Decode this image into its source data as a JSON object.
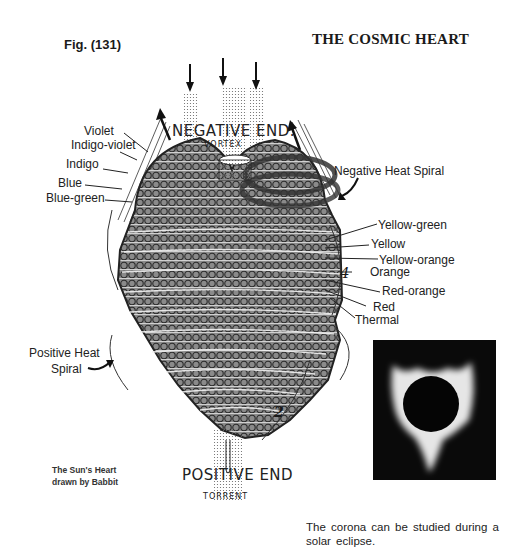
{
  "header": {
    "figure_label": "Fig. (131)",
    "title": "THE COSMIC HEART"
  },
  "diagram": {
    "top_label": "NEGATIVE END.",
    "bottom_label": "POSITIVE END",
    "vortex_label": "VORTEX",
    "torrent_label": "TORRENT",
    "inner_labels": [
      "ELECTRICAL COLORS",
      "SPIRALS FOR FRICTIONAL ELECTRICITY",
      "THERMAL COLORS",
      "EXTRA-SPIRALS",
      "INTRA-SPIRALS",
      "INFRA-SPIRALS",
      "TRANS-SPIRALS"
    ],
    "numbers": [
      "9",
      "8",
      "7",
      "10",
      "6",
      "5",
      "4",
      "3",
      "2",
      "1"
    ],
    "left_labels": [
      "Violet",
      "Indigo-violet",
      "Indigo",
      "Blue",
      "Blue-green"
    ],
    "right_top_label": "Negative Heat Spiral",
    "right_labels": [
      "Yellow-green",
      "Yellow",
      "Yellow-orange",
      "Orange",
      "Red-orange",
      "Red",
      "Thermal"
    ],
    "left_bottom_label_line1": "Positive Heat",
    "left_bottom_label_line2": "Spiral"
  },
  "captions": {
    "left_line1": "The Sun's Heart",
    "left_line2": "drawn by Babbit",
    "right_line1": "The corona can be studied during a",
    "right_line2": "solar eclipse."
  },
  "colors": {
    "ink": "#1a1a1a",
    "coil": "#3a3a3a",
    "paper": "#ffffff",
    "photo_bg": "#0a0a0a"
  }
}
